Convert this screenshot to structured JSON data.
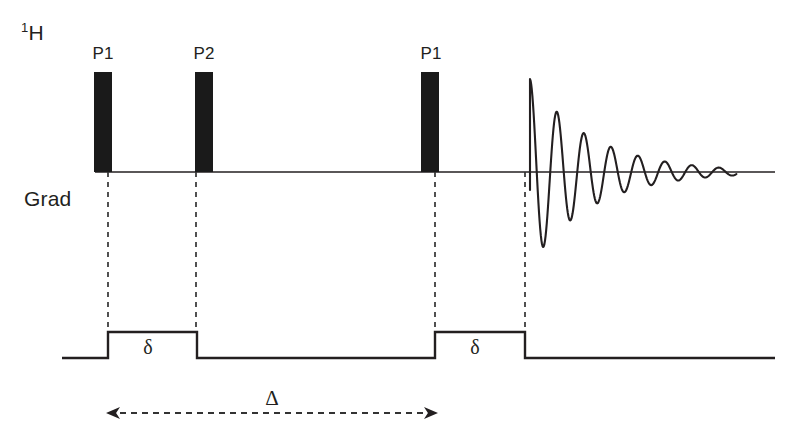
{
  "figure": {
    "type": "nmr-pulse-sequence",
    "name": "PGSE / stimulated-echo diffusion pulse sequence",
    "channels": [
      {
        "id": "rf",
        "label_html": "1H",
        "label_superscript": "1",
        "label_base": "H"
      },
      {
        "id": "grad",
        "label_html": "Grad",
        "label_base": "Grad"
      }
    ],
    "colors": {
      "ink": "#231f20",
      "background": "#ffffff",
      "pulse_fill": "#1a1a1a",
      "dashed": "#333333"
    }
  },
  "rf_channel": {
    "label": "1H",
    "superscript": "1",
    "element": "H",
    "baseline_y": 172,
    "baseline_x_start": 95,
    "baseline_x_end": 775,
    "pulses": [
      {
        "label": "P1",
        "x": 94,
        "width": 18,
        "top": 72,
        "bottom": 172
      },
      {
        "label": "P2",
        "x": 195,
        "width": 18,
        "top": 72,
        "bottom": 172
      },
      {
        "label": "P1",
        "x": 421,
        "width": 18,
        "top": 72,
        "bottom": 172
      }
    ],
    "fid": {
      "name": "free induction decay",
      "x_start": 530,
      "x_end": 737,
      "baseline_y": 172,
      "initial_amplitude": 93,
      "decay_constant": 62,
      "period": 27,
      "cycles": 8
    }
  },
  "grad_channel": {
    "label": "Grad",
    "baseline_y": 358,
    "pulse_top_y": 332,
    "line_x_start": 62,
    "line_x_end": 775,
    "pulses": [
      {
        "label": "δ",
        "x_start": 108,
        "x_end": 197
      },
      {
        "label": "δ",
        "x_start": 435,
        "x_end": 525
      }
    ]
  },
  "dashed_connectors": [
    {
      "x": 108,
      "y_top": 172,
      "y_bottom": 332
    },
    {
      "x": 196,
      "y_top": 172,
      "y_bottom": 332
    },
    {
      "x": 435,
      "y_top": 172,
      "y_bottom": 332
    },
    {
      "x": 525,
      "y_top": 172,
      "y_bottom": 332
    }
  ],
  "interval_arrow": {
    "label": "Δ",
    "x_start": 106,
    "x_end": 438,
    "y": 413,
    "style": "dashed double-headed"
  },
  "labels": {
    "delta_small": "δ",
    "delta_large": "Δ",
    "p1": "P1",
    "p2": "P2"
  }
}
